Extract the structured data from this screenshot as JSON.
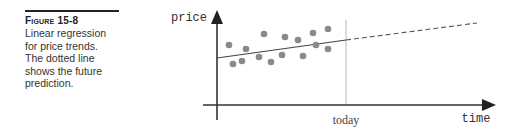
{
  "caption": {
    "label": "Figure 15-8",
    "lines": [
      "Linear regression",
      "for price trends.",
      "The dotted line",
      "shows the future",
      "prediction."
    ]
  },
  "chart_data": {
    "type": "scatter",
    "title": "",
    "xlabel": "time",
    "ylabel": "price",
    "x_marker_label": "today",
    "grid": false,
    "points": [
      {
        "x": 229,
        "y": 45
      },
      {
        "x": 233,
        "y": 64
      },
      {
        "x": 242,
        "y": 61
      },
      {
        "x": 246,
        "y": 49
      },
      {
        "x": 259,
        "y": 57
      },
      {
        "x": 264,
        "y": 34
      },
      {
        "x": 271,
        "y": 62
      },
      {
        "x": 282,
        "y": 55
      },
      {
        "x": 285,
        "y": 37
      },
      {
        "x": 298,
        "y": 40
      },
      {
        "x": 303,
        "y": 56
      },
      {
        "x": 313,
        "y": 33
      },
      {
        "x": 316,
        "y": 45
      },
      {
        "x": 328,
        "y": 29
      },
      {
        "x": 328,
        "y": 49
      }
    ],
    "regression_line": {
      "x1": 217,
      "y1": 58,
      "x2": 346,
      "y2": 40,
      "style": "solid"
    },
    "prediction_line": {
      "x1": 346,
      "y1": 40,
      "x2": 477,
      "y2": 23,
      "style": "dashed"
    },
    "colors": {
      "points": "#8a8a8a",
      "axis": "#333333",
      "line": "#444444",
      "today_line": "#b0b0b0"
    }
  }
}
